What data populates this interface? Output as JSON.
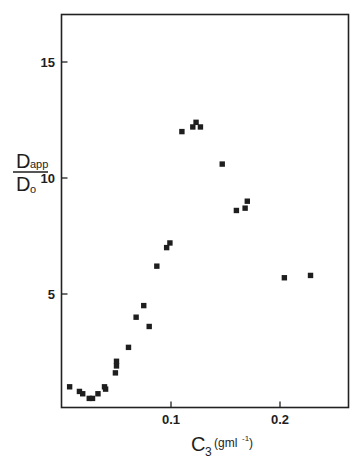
{
  "chart_data": {
    "type": "scatter",
    "title": "",
    "xlabel": "C3 (gml-1)",
    "xlabel_parts": {
      "main": "C",
      "sub": "3",
      "unit": "(gml",
      "unit_sup": "-1",
      "unit_close": ")"
    },
    "ylabel": "Dapp/Do",
    "ylabel_parts": {
      "numerator": "D",
      "numerator_sub": "app",
      "denominator": "D",
      "denominator_sub": "o"
    },
    "xlim": [
      0,
      0.264
    ],
    "ylim": [
      0,
      17
    ],
    "x_ticks": [
      0.1,
      0.2
    ],
    "x_tick_labels": [
      "0.1",
      "0.2"
    ],
    "y_ticks": [
      5,
      10,
      15
    ],
    "y_tick_labels": [
      "5",
      "10",
      "15"
    ],
    "grid": false,
    "legend": null,
    "marker": "square",
    "marker_color": "#1e1e1e",
    "series": [
      {
        "name": "Dapp/Do",
        "x": [
          0.007,
          0.016,
          0.019,
          0.025,
          0.028,
          0.033,
          0.039,
          0.04,
          0.049,
          0.05,
          0.05,
          0.061,
          0.068,
          0.075,
          0.08,
          0.087,
          0.096,
          0.099,
          0.11,
          0.12,
          0.123,
          0.127,
          0.147,
          0.16,
          0.168,
          0.17,
          0.204,
          0.228
        ],
        "y": [
          1.0,
          0.8,
          0.7,
          0.5,
          0.5,
          0.7,
          1.0,
          0.9,
          1.6,
          1.9,
          2.1,
          2.7,
          4.0,
          4.5,
          3.6,
          6.2,
          7.0,
          7.2,
          12.0,
          12.2,
          12.4,
          12.2,
          10.6,
          8.6,
          8.7,
          9.0,
          5.7,
          5.8
        ]
      }
    ]
  }
}
